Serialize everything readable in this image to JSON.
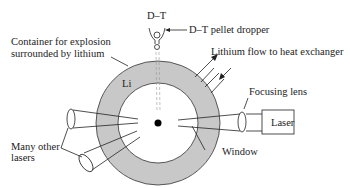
{
  "diagram": {
    "labels": {
      "dt_top": "D–T",
      "pellet_dropper": "D–T pellet dropper",
      "container": "Container for explosion",
      "container_line2": "surrounded by lithium",
      "lithium_flow": "Lithium flow to heat exchanger",
      "li": "Li",
      "focusing_lens": "Focusing lens",
      "laser": "Laser",
      "many_lasers": "Many other",
      "many_lasers_line2": "lasers",
      "window": "Window"
    },
    "colors": {
      "lithium_ring": "#c8c8c8",
      "lines": "#222222",
      "background": "#ffffff"
    }
  }
}
